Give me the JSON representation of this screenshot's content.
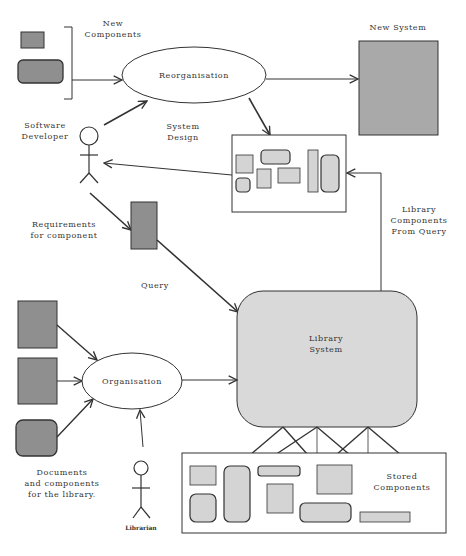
{
  "colors": {
    "dark_fill": "#8f8f8f",
    "light_fill": "#d4d4d4",
    "library_fill": "#d9d9d9",
    "new_system_fill": "#a9a9a9",
    "stroke": "#333333",
    "background": "#ffffff"
  },
  "labels": {
    "new_components": [
      "New",
      "Components"
    ],
    "new_system": "New System",
    "reorganisation": "Reorganisation",
    "software_developer": [
      "Software",
      "Developer"
    ],
    "system_design": [
      "System",
      "Design"
    ],
    "requirements": [
      "Requirements",
      "for component"
    ],
    "library_components": [
      "Library",
      "Components",
      "From Query"
    ],
    "query": "Query",
    "library_system": [
      "Library",
      "System"
    ],
    "organisation": "Organisation",
    "documents": [
      "Documents",
      "and components",
      "for the library."
    ],
    "stored_components": [
      "Stored",
      "Components"
    ],
    "librarian": "Librarian"
  },
  "nodes": {
    "new_components_items": [
      "small-rect",
      "rounded-rect"
    ],
    "reorganisation_process": "ellipse",
    "new_system_box": "rect",
    "system_design_box": "rect-with-components",
    "query_box": "rect",
    "library_system_box": "rounded-rect",
    "organisation_process": "ellipse",
    "document_items": [
      "rect",
      "rect",
      "rounded-rect"
    ],
    "stored_components_box": "rect-with-components",
    "actors": [
      "software-developer",
      "librarian"
    ]
  }
}
